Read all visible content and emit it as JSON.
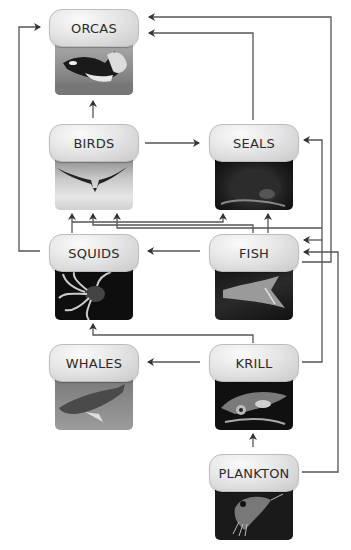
{
  "diagram": {
    "type": "food-web",
    "nodes": [
      {
        "id": "orcas",
        "label": "ORCAS",
        "image": "orca-photo"
      },
      {
        "id": "birds",
        "label": "BIRDS",
        "image": "bird-photo"
      },
      {
        "id": "seals",
        "label": "SEALS",
        "image": "seal-photo"
      },
      {
        "id": "squids",
        "label": "SQUIDS",
        "image": "squid-photo"
      },
      {
        "id": "fish",
        "label": "FISH",
        "image": "fish-photo"
      },
      {
        "id": "whales",
        "label": "WHALES",
        "image": "whale-photo"
      },
      {
        "id": "krill",
        "label": "KRILL",
        "image": "krill-photo"
      },
      {
        "id": "plankton",
        "label": "PLANKTON",
        "image": "plankton-photo"
      }
    ],
    "edges": [
      {
        "from": "birds",
        "to": "orcas"
      },
      {
        "from": "seals",
        "to": "orcas"
      },
      {
        "from": "squids",
        "to": "orcas"
      },
      {
        "from": "fish",
        "to": "orcas"
      },
      {
        "from": "birds",
        "to": "seals"
      },
      {
        "from": "squids",
        "to": "birds"
      },
      {
        "from": "squids",
        "to": "seals"
      },
      {
        "from": "fish",
        "to": "birds"
      },
      {
        "from": "fish",
        "to": "seals"
      },
      {
        "from": "fish",
        "to": "squids"
      },
      {
        "from": "krill",
        "to": "birds"
      },
      {
        "from": "krill",
        "to": "seals"
      },
      {
        "from": "krill",
        "to": "fish"
      },
      {
        "from": "krill",
        "to": "squids"
      },
      {
        "from": "krill",
        "to": "whales"
      },
      {
        "from": "plankton",
        "to": "krill"
      },
      {
        "from": "plankton",
        "to": "fish"
      }
    ],
    "colors": {
      "line": "#4a4a4a",
      "header_text": "#2b2b2b"
    }
  }
}
